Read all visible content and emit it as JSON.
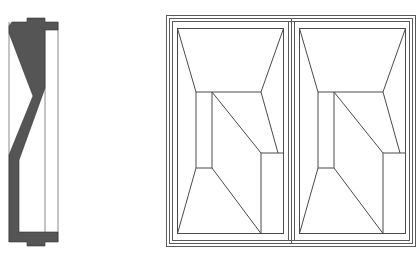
{
  "figure": {
    "colors": {
      "background": "#ffffff",
      "line": "#4a4a4a",
      "section_fill": "#555555",
      "frame_line": "#6a6a6a"
    },
    "section_view": {
      "label": "cross-section-profile"
    },
    "elevation_view": {
      "label": "double-door-elevation",
      "leaves": 2
    }
  }
}
